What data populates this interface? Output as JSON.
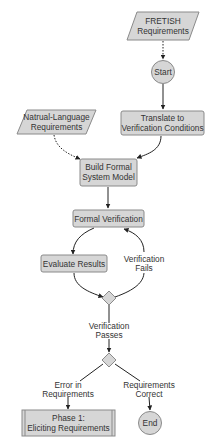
{
  "diagram": {
    "type": "flowchart",
    "colors": {
      "node_fill": "#d6d6d6",
      "node_stroke": "#8a8a8a",
      "text": "#333333",
      "edge": "#222222",
      "background": "#ffffff"
    },
    "nodes": {
      "fretish": {
        "shape": "parallelogram",
        "line1": "FRETISH",
        "line2": "Requirements"
      },
      "start": {
        "shape": "circle",
        "label": "Start"
      },
      "translate": {
        "shape": "rounded-rect",
        "line1": "Translate to",
        "line2": "Verification Conditions"
      },
      "natural_language": {
        "shape": "parallelogram",
        "line1": "Natrual-Language",
        "line2": "Requirements"
      },
      "build_model": {
        "shape": "rounded-rect",
        "line1": "Build Formal",
        "line2": "System Model"
      },
      "formal_verification": {
        "shape": "rounded-rect",
        "label": "Formal Verification"
      },
      "evaluate_results": {
        "shape": "rounded-rect",
        "label": "Evaluate Results"
      },
      "decision_1": {
        "shape": "diamond"
      },
      "decision_2": {
        "shape": "diamond"
      },
      "phase1": {
        "shape": "subprocess",
        "line1": "Phase 1:",
        "line2": "Eliciting Requirements"
      },
      "end": {
        "shape": "circle",
        "label": "End"
      }
    },
    "edge_labels": {
      "verification_fails": {
        "line1": "Verification",
        "line2": "Fails"
      },
      "verification_passes": {
        "line1": "Verification",
        "line2": "Passes"
      },
      "error_in_requirements": {
        "line1": "Error in",
        "line2": "Requirements"
      },
      "requirements_correct": {
        "line1": "Requirements",
        "line2": "Correct"
      }
    },
    "edges": [
      {
        "from": "fretish",
        "to": "start",
        "style": "dotted"
      },
      {
        "from": "start",
        "to": "translate",
        "style": "solid"
      },
      {
        "from": "translate",
        "to": "build_model",
        "style": "solid"
      },
      {
        "from": "natural_language",
        "to": "build_model",
        "style": "dotted"
      },
      {
        "from": "build_model",
        "to": "formal_verification",
        "style": "solid"
      },
      {
        "from": "formal_verification",
        "to": "evaluate_results",
        "style": "solid"
      },
      {
        "from": "evaluate_results",
        "to": "decision_1",
        "style": "solid"
      },
      {
        "from": "decision_1",
        "to": "formal_verification",
        "style": "solid",
        "label": "verification_fails"
      },
      {
        "from": "decision_1",
        "to": "decision_2",
        "style": "solid",
        "label": "verification_passes"
      },
      {
        "from": "decision_2",
        "to": "phase1",
        "style": "solid",
        "label": "error_in_requirements"
      },
      {
        "from": "decision_2",
        "to": "end",
        "style": "solid",
        "label": "requirements_correct"
      }
    ]
  }
}
